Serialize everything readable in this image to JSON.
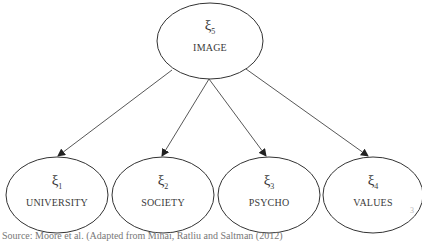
{
  "diagram": {
    "top_node": {
      "symbol": "ξ",
      "subscript": "5",
      "label": "IMAGE"
    },
    "child_nodes": [
      {
        "symbol": "ξ",
        "subscript": "1",
        "label": "UNIVERSITY"
      },
      {
        "symbol": "ξ",
        "subscript": "2",
        "label": "SOCIETY"
      },
      {
        "symbol": "ξ",
        "subscript": "3",
        "label": "PSYCHO"
      },
      {
        "symbol": "ξ",
        "subscript": "4",
        "label": "VALUES"
      }
    ],
    "edges": [
      {
        "from": "IMAGE",
        "to": "UNIVERSITY"
      },
      {
        "from": "IMAGE",
        "to": "SOCIETY"
      },
      {
        "from": "IMAGE",
        "to": "PSYCHO"
      },
      {
        "from": "IMAGE",
        "to": "VALUES"
      }
    ],
    "line_color": "#333333"
  },
  "caption": "Source: Moore et al. (Adapted from Mihai, Ratliu and Saltman (2012)",
  "page_mark": "3"
}
